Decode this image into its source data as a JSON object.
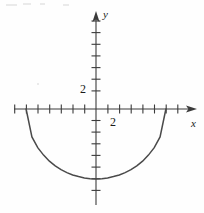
{
  "figure": {
    "kind": "cartesian-graph",
    "width": 204,
    "height": 213,
    "background_color": "#fefefe",
    "ink_color": "#3b3b3b",
    "text_color": "#1a1a1a"
  },
  "axes": {
    "x": {
      "name": "x",
      "arrow": "right",
      "pixel_y": 109,
      "pixel_start": 14,
      "pixel_end": 197,
      "unit_px": 23.3,
      "tick_spacing_px": 11.65,
      "tick_labels": [
        {
          "text": "2",
          "value": 2
        }
      ]
    },
    "y": {
      "name": "y",
      "arrow": "up",
      "pixel_x": 96,
      "pixel_start": 12,
      "pixel_end": 205,
      "unit_px": 23.3,
      "tick_spacing_px": 11.65,
      "tick_labels": [
        {
          "text": "2",
          "value": 2
        }
      ]
    },
    "origin_px": {
      "x": 96,
      "y": 109
    }
  },
  "chart_data": {
    "type": "line",
    "title": "",
    "xlabel": "x",
    "ylabel": "y",
    "xlim": [
      -3.5,
      4.3
    ],
    "ylim": [
      -4.2,
      4.2
    ],
    "grid": false,
    "legend": "none",
    "curve_description": "lower semicircle of radius 3 centered at the origin",
    "equation": "y = -sqrt(9 - x^2)",
    "endpoints": [
      {
        "x": -3,
        "y": 0
      },
      {
        "x": 3,
        "y": 0
      }
    ],
    "minimum_point": {
      "x": 0,
      "y": -3
    },
    "x": [
      -3,
      -2.75,
      -2.5,
      -2.25,
      -2,
      -1.75,
      -1.5,
      -1.25,
      -1,
      -0.75,
      -0.5,
      -0.25,
      0,
      0.25,
      0.5,
      0.75,
      1,
      1.25,
      1.5,
      1.75,
      2,
      2.25,
      2.5,
      2.75,
      3
    ],
    "y": [
      0,
      -1.2,
      -1.66,
      -1.98,
      -2.24,
      -2.44,
      -2.6,
      -2.73,
      -2.83,
      -2.9,
      -2.96,
      -2.99,
      -3,
      -2.99,
      -2.96,
      -2.9,
      -2.83,
      -2.73,
      -2.6,
      -2.44,
      -2.24,
      -1.98,
      -1.66,
      -1.2,
      0
    ]
  },
  "x_ticks_px": [
    14.7,
    26.4,
    38.0,
    49.7,
    61.3,
    73.0,
    84.7,
    107.9,
    119.6,
    131.2,
    142.9,
    154.5,
    166.2,
    177.8
  ],
  "y_ticks_px": [
    21.0,
    32.6,
    44.3,
    55.9,
    67.6,
    79.2,
    90.9,
    120.5,
    132.1,
    143.8,
    155.4,
    167.1,
    178.7,
    190.4
  ],
  "artifacts": [
    {
      "name": "scan-speck",
      "left": 6,
      "top": 4,
      "width": 11,
      "height": 2
    },
    {
      "name": "scan-speck",
      "left": 23,
      "top": 3,
      "width": 8,
      "height": 2
    },
    {
      "name": "scan-speck",
      "left": 40,
      "top": 3,
      "width": 5,
      "height": 2
    },
    {
      "name": "scan-speck",
      "left": 63,
      "top": 4,
      "width": 6,
      "height": 2
    },
    {
      "name": "scan-speck",
      "left": 37,
      "top": 83,
      "width": 2,
      "height": 2
    }
  ]
}
